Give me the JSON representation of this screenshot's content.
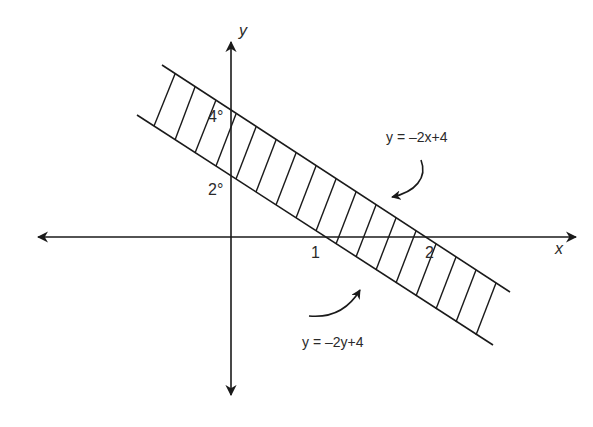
{
  "diagram": {
    "type": "coordinate-graph-shaded-band",
    "axes": {
      "x_label": "x",
      "y_label": "y"
    },
    "tick_labels": {
      "y_upper": "4°",
      "y_lower": "2°",
      "x_first": "1",
      "x_second": "2"
    },
    "annotations": {
      "upper_line": "y = –2x+4",
      "lower_line": "y = –2y+4"
    },
    "colors": {
      "line": "#1a1a1a",
      "background": "#ffffff"
    }
  }
}
